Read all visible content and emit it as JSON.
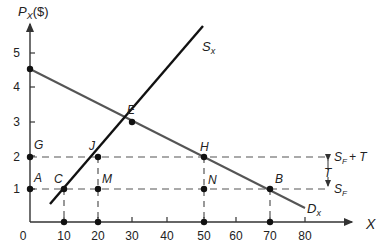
{
  "diagram": {
    "type": "supply-demand-tariff",
    "y_axis_label": "P",
    "y_axis_label_sub": "X",
    "y_axis_unit": "($)",
    "x_axis_label": "X",
    "y_ticks": [
      "1",
      "2",
      "3",
      "4",
      "5"
    ],
    "x_ticks": [
      "10",
      "20",
      "30",
      "40",
      "50",
      "60",
      "70",
      "80"
    ],
    "origin_label": "0",
    "curves": {
      "supply": {
        "label": "S",
        "sub": "x",
        "color": "#111111"
      },
      "demand": {
        "label": "D",
        "sub": "x",
        "color": "#555555"
      }
    },
    "price_lines": {
      "tariff": {
        "label": "S",
        "sub": "F",
        "suffix": "+ T",
        "price": 2
      },
      "free_trade": {
        "label": "S",
        "sub": "F",
        "price": 1
      },
      "tariff_gap_label": "T"
    },
    "points": {
      "A": "A",
      "B": "B",
      "C": "C",
      "E": "E",
      "G": "G",
      "H": "H",
      "J": "J",
      "M": "M",
      "N": "N"
    }
  }
}
